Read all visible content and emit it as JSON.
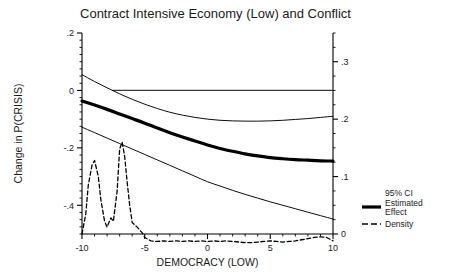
{
  "chart_data": {
    "type": "line",
    "title": "Contract Intensive Economy (Low) and Conflict",
    "xlabel": "DEMOCRACY (LOW)",
    "ylabel": "Change in P(CRISIS)",
    "y2label": "",
    "xlim": [
      -10,
      10
    ],
    "ylim": [
      -0.5,
      0.2
    ],
    "y2lim": [
      0,
      0.35
    ],
    "grid": false,
    "legend_position": "right",
    "xticks": [
      -10,
      -5,
      0,
      5,
      10
    ],
    "xticklabels": [
      "-10",
      "-5",
      "0",
      "5",
      "10"
    ],
    "yticks": [
      0.2,
      0,
      -0.2,
      -0.4
    ],
    "yticklabels": [
      ".2",
      "0",
      "-.2",
      "-.4"
    ],
    "y2ticks": [
      0.3,
      0.2,
      0.1,
      0
    ],
    "y2ticklabels": [
      ".3",
      ".2",
      ".1",
      "0"
    ],
    "reference_line": {
      "y": 0,
      "x_start": -10,
      "x_end": 10
    },
    "x": [
      -10,
      -9,
      -8,
      -7,
      -6,
      -5,
      -4,
      -3,
      -2,
      -1,
      0,
      1,
      2,
      3,
      4,
      5,
      6,
      7,
      8,
      9,
      10
    ],
    "series": [
      {
        "name": "Estimated Effect",
        "axis": "left",
        "style": "solid-thick",
        "values": [
          -0.037,
          -0.051,
          -0.066,
          -0.082,
          -0.098,
          -0.114,
          -0.131,
          -0.147,
          -0.162,
          -0.176,
          -0.19,
          -0.202,
          -0.212,
          -0.221,
          -0.228,
          -0.234,
          -0.238,
          -0.241,
          -0.243,
          -0.245,
          -0.246
        ]
      },
      {
        "name": "95% CI Upper",
        "axis": "left",
        "style": "solid-thin",
        "values": [
          0.055,
          0.031,
          0.009,
          -0.012,
          -0.031,
          -0.048,
          -0.063,
          -0.076,
          -0.086,
          -0.094,
          -0.1,
          -0.104,
          -0.106,
          -0.107,
          -0.107,
          -0.106,
          -0.104,
          -0.101,
          -0.098,
          -0.094,
          -0.09
        ]
      },
      {
        "name": "95% CI Lower",
        "axis": "left",
        "style": "solid-thin",
        "values": [
          -0.128,
          -0.147,
          -0.166,
          -0.185,
          -0.204,
          -0.223,
          -0.242,
          -0.261,
          -0.28,
          -0.299,
          -0.318,
          -0.333,
          -0.348,
          -0.362,
          -0.375,
          -0.388,
          -0.4,
          -0.412,
          -0.424,
          -0.436,
          -0.448
        ]
      },
      {
        "name": "Density",
        "axis": "right",
        "style": "dashed",
        "x": [
          -10,
          -9.7,
          -9.5,
          -9.2,
          -9.0,
          -8.7,
          -8.5,
          -8.2,
          -8.0,
          -7.7,
          -7.5,
          -7.2,
          -7.0,
          -6.8,
          -6.6,
          -6.4,
          -6.2,
          -6.0,
          -5.6,
          -5.2,
          -5.0,
          -4.5,
          -4.0,
          -3.5,
          -3.0,
          -2.5,
          -2.0,
          -1.5,
          -1.0,
          -0.5,
          0.0,
          0.5,
          1.0,
          1.5,
          2.0,
          2.5,
          3.0,
          3.5,
          4.0,
          4.5,
          5.0,
          5.5,
          6.0,
          6.5,
          7.0,
          7.5,
          8.0,
          8.5,
          9.0,
          9.5,
          10.0
        ],
        "values": [
          0.0,
          0.035,
          0.085,
          0.12,
          0.128,
          0.1,
          0.06,
          0.022,
          0.012,
          0.028,
          0.022,
          0.075,
          0.148,
          0.16,
          0.135,
          0.09,
          0.05,
          0.02,
          0.012,
          0.002,
          -0.006,
          -0.012,
          -0.013,
          -0.012,
          -0.013,
          -0.012,
          -0.013,
          -0.012,
          -0.013,
          -0.012,
          -0.013,
          -0.012,
          -0.013,
          -0.012,
          -0.013,
          -0.014,
          -0.015,
          -0.015,
          -0.014,
          -0.013,
          -0.012,
          -0.013,
          -0.014,
          -0.013,
          -0.012,
          -0.01,
          -0.008,
          -0.006,
          -0.005,
          -0.006,
          -0.012
        ]
      }
    ],
    "legend": [
      {
        "label": "95% CI",
        "style": "none"
      },
      {
        "label": "Estimated Effect",
        "style": "solid-thick"
      },
      {
        "label": "Density",
        "style": "dashed"
      }
    ]
  }
}
